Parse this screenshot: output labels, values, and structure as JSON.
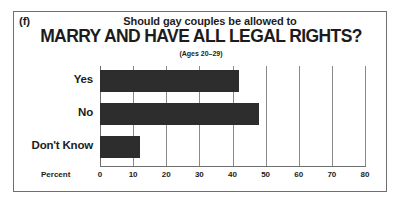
{
  "figure": {
    "panel_letter": "(f)",
    "subtitle": "Should gay couples be allowed to",
    "title": "MARRY AND HAVE ALL LEGAL RIGHTS?",
    "age_note": "(Ages 20–29)",
    "axis_name": "Percent",
    "bar_color": "#2d2d2d",
    "frame_color": "#6f6f6f",
    "grid_color": "#8a8a8a",
    "text_color": "#1c1c1c"
  },
  "chart_data": {
    "type": "bar",
    "orientation": "horizontal",
    "title": "MARRY AND HAVE ALL LEGAL RIGHTS?",
    "subtitle": "Should gay couples be allowed to",
    "annotation": "(Ages 20–29)",
    "panel_label": "(f)",
    "categories": [
      "Yes",
      "No",
      "Don't Know"
    ],
    "values": [
      42,
      48,
      12
    ],
    "xlabel": "Percent",
    "ylabel": "",
    "xlim": [
      0,
      80
    ],
    "xticks": [
      0,
      10,
      20,
      30,
      40,
      50,
      60,
      70,
      80
    ],
    "xtick_labels": [
      "0",
      "10",
      "20",
      "30",
      "40",
      "50",
      "60",
      "70",
      "80"
    ],
    "grid": true,
    "grid_axis": "x",
    "legend": false
  }
}
